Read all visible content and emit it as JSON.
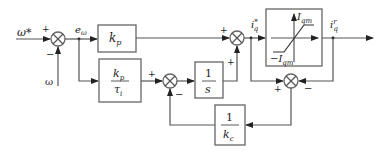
{
  "diagram": {
    "type": "control-block-diagram",
    "inputs": {
      "reference": "ω*",
      "feedback": "ω"
    },
    "signals": {
      "error": "e",
      "error_sub": "ω",
      "iq_ref_base": "i",
      "iq_ref_sub": "q",
      "iq_ref_sup": "*",
      "iq_out_base": "i",
      "iq_out_sub": "q",
      "iq_out_sup": "r"
    },
    "blocks": {
      "kp": {
        "base": "k",
        "sub": "p"
      },
      "ki": {
        "num_base": "k",
        "num_sub": "p",
        "den_base": "τ",
        "den_sub": "i"
      },
      "integrator": {
        "num": "1",
        "den": "s"
      },
      "antiwindup_gain": {
        "num": "1",
        "den_base": "k",
        "den_sub": "c"
      },
      "saturation": {
        "upper_base": "I",
        "upper_sub": "qm",
        "lower_base": "−I",
        "lower_sub": "qm"
      }
    },
    "signs": {
      "sum1_top": "+",
      "sum1_bottom": "−",
      "sum2_left": "+",
      "sum2_bottom": "−",
      "sum3_left": "+",
      "sum3_bottom": "+",
      "sum4_left": "+",
      "sum4_right": "−"
    }
  }
}
